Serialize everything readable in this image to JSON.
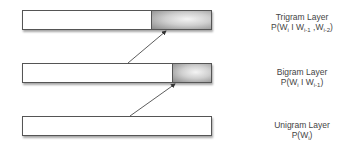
{
  "layers": [
    {
      "name": "Trigram Layer",
      "formula": {
        "prefix": "P(W",
        "sub1": "i",
        "mid": " I W",
        "sub2": "i-1",
        "mid2": " ,W",
        "sub3": "i-2",
        "suffix": ")"
      }
    },
    {
      "name": "Bigram Layer",
      "formula": {
        "prefix": "P(W",
        "sub1": "i",
        "mid": " I W",
        "sub2": "i-1",
        "suffix": ")"
      }
    },
    {
      "name": "Unigram Layer",
      "formula": {
        "prefix": "P(W",
        "sub1": "i",
        "suffix": ")"
      }
    }
  ]
}
